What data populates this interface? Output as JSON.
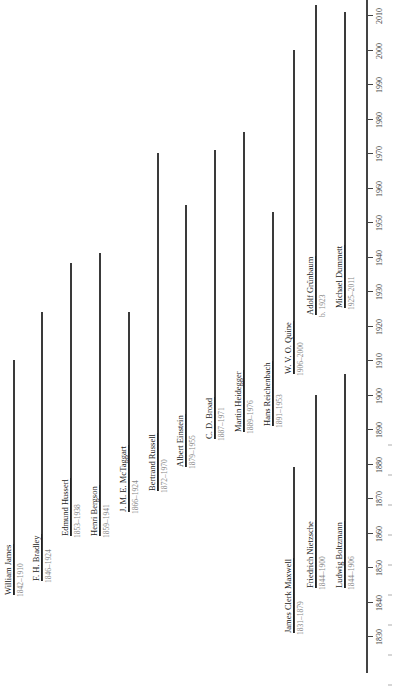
{
  "chart_data": {
    "type": "timeline",
    "orientation": "rotated-90-ccw",
    "title": "",
    "xlabel": "",
    "ylabel": "Year",
    "ylim": [
      1830,
      2013
    ],
    "ticks": [
      1830,
      1840,
      1850,
      1860,
      1870,
      1880,
      1890,
      1900,
      1910,
      1920,
      1930,
      1940,
      1950,
      1960,
      1970,
      1980,
      1990,
      2000,
      2010
    ],
    "series": [
      {
        "name": "William James",
        "dates": "1842–1910",
        "start": 1842,
        "end": 1910,
        "x": 13
      },
      {
        "name": "F. H. Bradley",
        "dates": "1846–1924",
        "start": 1846,
        "end": 1924,
        "x": 41
      },
      {
        "name": "Edmund Husserl",
        "dates": "1853–1938",
        "start": 1859,
        "end": 1938,
        "x": 70
      },
      {
        "name": "Henri Bergson",
        "dates": "1859–1941",
        "start": 1859,
        "end": 1941,
        "x": 99
      },
      {
        "name": "J. M. E. McTaggart",
        "dates": "1866–1924",
        "start": 1866,
        "end": 1924,
        "x": 128
      },
      {
        "name": "Bertrand Russell",
        "dates": "1872–1970",
        "start": 1872,
        "end": 1970,
        "x": 157
      },
      {
        "name": "Albert Einstein",
        "dates": "1879–1955",
        "start": 1879,
        "end": 1955,
        "x": 185
      },
      {
        "name": "C. D. Broad",
        "dates": "1887–1971",
        "start": 1887,
        "end": 1971,
        "x": 214
      },
      {
        "name": "Martin Heidegger",
        "dates": "1889–1976",
        "start": 1889,
        "end": 1976,
        "x": 243
      },
      {
        "name": "Hans Reichenbach",
        "dates": "1891–1953",
        "start": 1891,
        "end": 1953,
        "x": 272
      },
      {
        "name": "W. V. O. Quine",
        "dates": "1906–2000",
        "start": 1906,
        "end": 2000,
        "x": 293
      },
      {
        "name": "Adolf Grünbaum",
        "dates": "b. 1923",
        "start": 1923,
        "end": 2013,
        "x": 315
      },
      {
        "name": "Michael Dummett",
        "dates": "1925–2011",
        "start": 1925,
        "end": 2011,
        "x": 344
      },
      {
        "name": "James Clerk Maxwell",
        "dates": "1831–1879",
        "start": 1831,
        "end": 1879,
        "x": 293
      },
      {
        "name": "Friedrich Nietzsche",
        "dates": "1844–1900",
        "start": 1844,
        "end": 1900,
        "x": 315
      },
      {
        "name": "Ludwig Boltzmann",
        "dates": "1844–1906",
        "start": 1844,
        "end": 1906,
        "x": 344
      }
    ],
    "grid": false,
    "legend": "none"
  }
}
